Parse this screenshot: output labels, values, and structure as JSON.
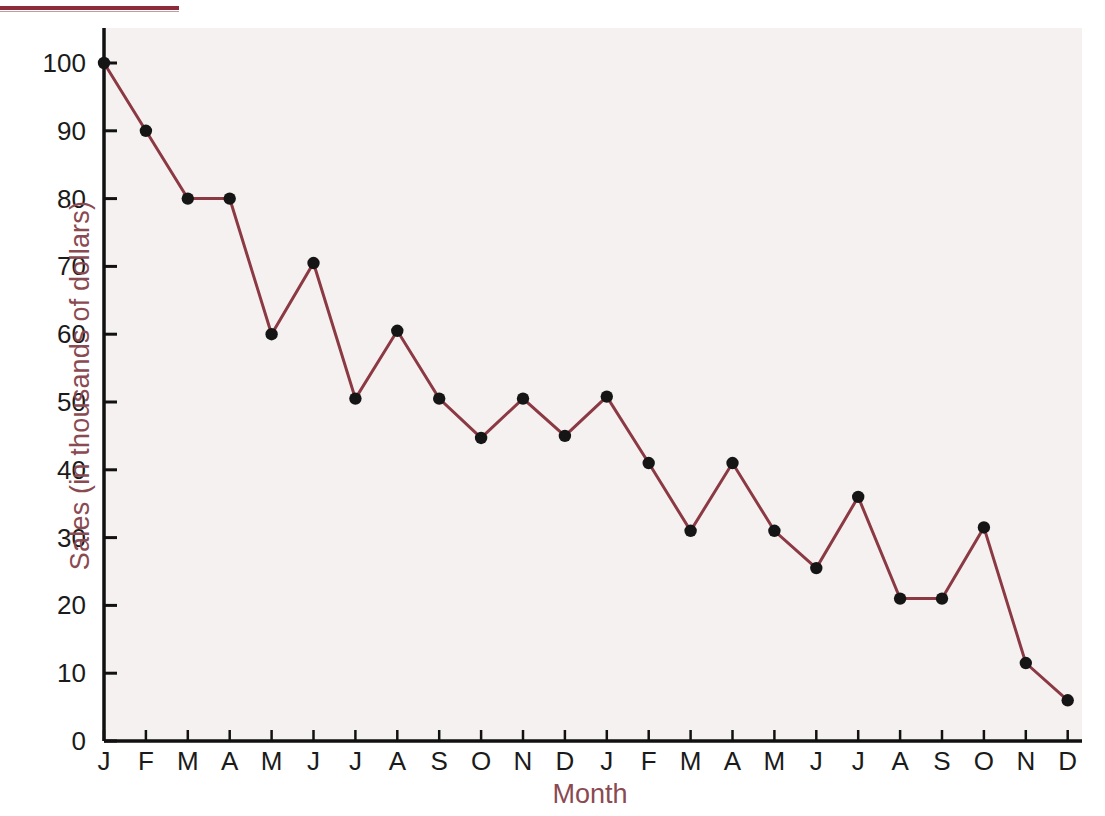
{
  "figure": {
    "accent_color": "#8c2b3a",
    "label_color": "#8a4a52",
    "line_color": "#8b3a44",
    "marker_color": "#151515",
    "plot_background": "#f6f1f1",
    "axis_color": "#111111",
    "tick_text_color": "#1b1b1b"
  },
  "chart_data": {
    "type": "line",
    "title": "",
    "xlabel": "Month",
    "ylabel": "Sales (in thousands of dollars)",
    "ylim": [
      0,
      100
    ],
    "yticks": [
      0,
      10,
      20,
      30,
      40,
      50,
      60,
      70,
      80,
      90,
      100
    ],
    "ytick_labels": [
      "0",
      "10",
      "20",
      "30",
      "40",
      "50",
      "60",
      "70",
      "80",
      "90",
      "100"
    ],
    "grid": false,
    "legend": null,
    "markers": "filled-circle",
    "categories": [
      "J",
      "F",
      "M",
      "A",
      "M",
      "J",
      "J",
      "A",
      "S",
      "O",
      "N",
      "D",
      "J",
      "F",
      "M",
      "A",
      "M",
      "J",
      "J",
      "A",
      "S",
      "O",
      "N",
      "D"
    ],
    "values": [
      100,
      90,
      80,
      80,
      60,
      70.5,
      50.5,
      60.5,
      50.5,
      44.7,
      50.5,
      45,
      50.8,
      41,
      31,
      41,
      31,
      25.5,
      36,
      21,
      21,
      31.5,
      11.5,
      6
    ]
  }
}
